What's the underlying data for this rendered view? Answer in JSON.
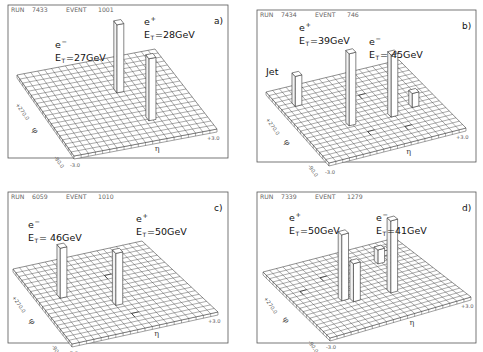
{
  "figure": {
    "grid_cells": 20,
    "axes": {
      "phi_symbol": "φ",
      "eta_symbol": "η",
      "phi_high": "+270.0",
      "phi_low": "-90.0",
      "eta_low": "-3.0",
      "eta_high": "+3.0"
    }
  },
  "panels": [
    {
      "id": "a",
      "label": "a)",
      "run_label": "RUN",
      "run": "7433",
      "event_label": "EVENT",
      "event": "1001",
      "box": {
        "x": 8,
        "y": 5,
        "w": 220,
        "h": 153
      },
      "grid": {
        "bl": [
          17,
          75
        ],
        "br": [
          155,
          49
        ],
        "fr": [
          217,
          129
        ],
        "fl": [
          74,
          156
        ]
      },
      "towers": [
        {
          "name": "e-",
          "particle": "e",
          "charge": "−",
          "et_label": "E",
          "et_sub": "T",
          "et_value": "=27GeV",
          "u": 0.62,
          "v": 0.72,
          "height": 62,
          "label_pos": [
            55,
            48
          ]
        },
        {
          "name": "e+",
          "particle": "e",
          "charge": "+",
          "et_label": "E",
          "et_sub": "T",
          "et_value": "=28GeV",
          "u": 0.55,
          "v": 0.35,
          "height": 68,
          "label_pos": [
            144,
            25
          ]
        }
      ],
      "hits": []
    },
    {
      "id": "b",
      "label": "b)",
      "run_label": "RUN",
      "run": "7434",
      "event_label": "EVENT",
      "event": "746",
      "box": {
        "x": 257,
        "y": 10,
        "w": 219,
        "h": 152
      },
      "grid": {
        "bl": [
          266,
          92
        ],
        "br": [
          399,
          60
        ],
        "fr": [
          466,
          128
        ],
        "fl": [
          329,
          163
        ]
      },
      "towers": [
        {
          "name": "jet",
          "particle": "Jet",
          "charge": "",
          "et_label": "",
          "et_sub": "",
          "et_value": "",
          "u": 0.1,
          "v": 0.2,
          "height": 30,
          "label_pos": [
            266,
            75
          ]
        },
        {
          "name": "e+",
          "particle": "e",
          "charge": "+",
          "et_label": "E",
          "et_sub": "T",
          "et_value": "=39GeV",
          "u": 0.32,
          "v": 0.58,
          "height": 72,
          "label_pos": [
            299,
            31
          ]
        },
        {
          "name": "e-",
          "particle": "e",
          "charge": "−",
          "et_label": "E",
          "et_sub": "T",
          "et_value": "= 45GeV",
          "u": 0.62,
          "v": 0.6,
          "height": 62,
          "label_pos": [
            369,
            45
          ]
        },
        {
          "name": "low",
          "particle": "",
          "charge": "",
          "et_label": "",
          "et_sub": "",
          "et_value": "",
          "u": 0.8,
          "v": 0.55,
          "height": 14,
          "label_pos": [
            0,
            0
          ]
        }
      ],
      "hits": [
        [
          0.55,
          0.3
        ],
        [
          0.4,
          0.75
        ],
        [
          0.65,
          0.8
        ]
      ]
    },
    {
      "id": "c",
      "label": "c)",
      "run_label": "RUN",
      "run": "6059",
      "event_label": "EVENT",
      "event": "1010",
      "box": {
        "x": 8,
        "y": 192,
        "w": 220,
        "h": 151
      },
      "grid": {
        "bl": [
          13,
          269
        ],
        "br": [
          142,
          241
        ],
        "fr": [
          218,
          312
        ],
        "fl": [
          72,
          344
        ]
      },
      "towers": [
        {
          "name": "e-",
          "particle": "e",
          "charge": "−",
          "et_label": "E",
          "et_sub": "T",
          "et_value": "= 46GeV",
          "u": 0.15,
          "v": 0.4,
          "height": 50,
          "label_pos": [
            28,
            228
          ]
        },
        {
          "name": "e+",
          "particle": "e",
          "charge": "+",
          "et_label": "E",
          "et_sub": "T",
          "et_value": "=50GeV",
          "u": 0.45,
          "v": 0.62,
          "height": 52,
          "label_pos": [
            136,
            222
          ]
        }
      ],
      "hits": [
        [
          0.55,
          0.3
        ],
        [
          0.5,
          0.8
        ]
      ]
    },
    {
      "id": "d",
      "label": "d)",
      "run_label": "RUN",
      "run": "7339",
      "event_label": "EVENT",
      "event": "1279",
      "box": {
        "x": 257,
        "y": 192,
        "w": 219,
        "h": 151
      },
      "grid": {
        "bl": [
          263,
          272
        ],
        "br": [
          395,
          238
        ],
        "fr": [
          471,
          297
        ],
        "fl": [
          330,
          338
        ]
      },
      "towers": [
        {
          "name": "e+",
          "particle": "e",
          "charge": "+",
          "et_label": "E",
          "et_sub": "T",
          "et_value": "=50GeV",
          "u": 0.28,
          "v": 0.55,
          "height": 66,
          "label_pos": [
            289,
            221
          ]
        },
        {
          "name": "e+-shoulder",
          "particle": "",
          "charge": "",
          "et_label": "",
          "et_sub": "",
          "et_value": "",
          "u": 0.34,
          "v": 0.6,
          "height": 38,
          "label_pos": [
            0,
            0
          ]
        },
        {
          "name": "e-",
          "particle": "e",
          "charge": "−",
          "et_label": "E",
          "et_sub": "T",
          "et_value": "=41GeV",
          "u": 0.6,
          "v": 0.62,
          "height": 72,
          "label_pos": [
            376,
            221
          ]
        },
        {
          "name": "jet1",
          "particle": "",
          "charge": "",
          "et_label": "",
          "et_sub": "",
          "et_value": "",
          "u": 0.72,
          "v": 0.22,
          "height": 14,
          "label_pos": [
            0,
            0
          ]
        },
        {
          "name": "jet2",
          "particle": "",
          "charge": "",
          "et_label": "",
          "et_sub": "",
          "et_value": "",
          "u": 0.8,
          "v": 0.14,
          "height": 5,
          "label_pos": [
            0,
            0
          ]
        }
      ],
      "hits": [
        [
          0.1,
          0.35
        ],
        [
          0.3,
          0.25
        ]
      ]
    }
  ],
  "chart_data": [
    {
      "type": "table",
      "title": "a)",
      "run": 7433,
      "event": 1001,
      "deposits": [
        {
          "particle": "e-",
          "ET_GeV": 27
        },
        {
          "particle": "e+",
          "ET_GeV": 28
        }
      ],
      "xlabel": "η",
      "ylabel": "φ",
      "xlim": [
        -3.0,
        3.0
      ],
      "ylim": [
        -90.0,
        270.0
      ]
    },
    {
      "type": "table",
      "title": "b)",
      "run": 7434,
      "event": 746,
      "deposits": [
        {
          "particle": "e+",
          "ET_GeV": 39
        },
        {
          "particle": "e-",
          "ET_GeV": 45
        },
        {
          "particle": "Jet",
          "ET_GeV": null
        }
      ],
      "xlabel": "η",
      "ylabel": "φ",
      "xlim": [
        -3.0,
        3.0
      ],
      "ylim": [
        -90.0,
        270.0
      ]
    },
    {
      "type": "table",
      "title": "c)",
      "run": 6059,
      "event": 1010,
      "deposits": [
        {
          "particle": "e-",
          "ET_GeV": 46
        },
        {
          "particle": "e+",
          "ET_GeV": 50
        }
      ],
      "xlabel": "η",
      "ylabel": "φ",
      "xlim": [
        -3.0,
        3.0
      ],
      "ylim": [
        -90.0,
        270.0
      ]
    },
    {
      "type": "table",
      "title": "d)",
      "run": 7339,
      "event": 1279,
      "deposits": [
        {
          "particle": "e+",
          "ET_GeV": 50
        },
        {
          "particle": "e-",
          "ET_GeV": 41
        }
      ],
      "xlabel": "η",
      "ylabel": "φ",
      "xlim": [
        -3.0,
        3.0
      ],
      "ylim": [
        -90.0,
        270.0
      ]
    }
  ]
}
